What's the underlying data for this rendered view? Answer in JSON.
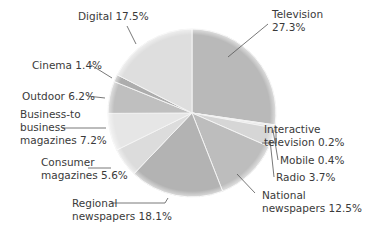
{
  "chart_data": {
    "type": "pie",
    "title": "",
    "start_angle": "12 o'clock",
    "direction": "clockwise",
    "categories": [
      "Television",
      "Interactive television",
      "Mobile",
      "Radio",
      "National newspapers",
      "Regional newspapers",
      "Consumer magazines",
      "Business-to business magazines",
      "Outdoor",
      "Cinema",
      "Digital"
    ],
    "values": [
      27.3,
      0.2,
      0.4,
      3.7,
      12.5,
      18.1,
      5.6,
      7.2,
      6.2,
      1.4,
      17.5
    ],
    "unit": "%",
    "colors": [
      "#b9b9b9",
      "#d8d8d8",
      "#e2e2e2",
      "#d6d6d6",
      "#bdbdbd",
      "#b3b3b3",
      "#dcdcdc",
      "#e6e6e6",
      "#bfbfbf",
      "#adadad",
      "#dedede"
    ],
    "legend": "none (direct labels with leader lines)"
  },
  "labels": [
    {
      "lines": [
        "Television",
        "27.3%"
      ]
    },
    {
      "lines": [
        "Interactive",
        "television 0.2%"
      ]
    },
    {
      "lines": [
        "Mobile 0.4%"
      ]
    },
    {
      "lines": [
        "Radio 3.7%"
      ]
    },
    {
      "lines": [
        "National",
        "newspapers 12.5%"
      ]
    },
    {
      "lines": [
        "Regional",
        "newspapers 18.1%"
      ]
    },
    {
      "lines": [
        "Consumer",
        "magazines 5.6%"
      ]
    },
    {
      "lines": [
        "Business-to",
        "business",
        "magazines 7.2%"
      ]
    },
    {
      "lines": [
        "Outdoor 6.2%"
      ]
    },
    {
      "lines": [
        "Cinema 1.4%"
      ]
    },
    {
      "lines": [
        "Digital 17.5%"
      ]
    }
  ]
}
